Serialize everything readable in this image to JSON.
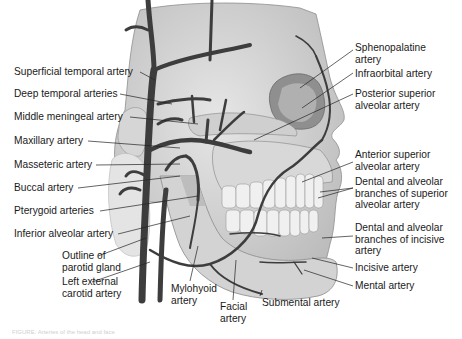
{
  "figure": {
    "caption": "FIGURE: Arteries of the head and face",
    "colors": {
      "artery": "#3d3d3d",
      "bone": "#d9d9d9",
      "bone_shadow": "#a8a8a8",
      "teeth": "#efefef",
      "skin_outline": "#c8c8c8",
      "leader_line": "#222222",
      "text": "#1a1a1a"
    }
  },
  "labels_left": [
    {
      "id": "superficial-temporal",
      "text": "Superficial temporal artery"
    },
    {
      "id": "deep-temporal",
      "text": "Deep temporal arteries"
    },
    {
      "id": "middle-meningeal",
      "text": "Middle meningeal artery"
    },
    {
      "id": "maxillary",
      "text": "Maxillary artery"
    },
    {
      "id": "masseteric",
      "text": "Masseteric artery"
    },
    {
      "id": "buccal",
      "text": "Buccal artery"
    },
    {
      "id": "pterygoid",
      "text": "Pterygoid arteries"
    },
    {
      "id": "inferior-alveolar",
      "text": "Inferior alveolar artery"
    },
    {
      "id": "parotid-outline",
      "line1": "Outline of",
      "line2": "parotid gland"
    },
    {
      "id": "left-external-carotid",
      "line1": "Left external",
      "line2": "carotid artery"
    }
  ],
  "labels_bottom": [
    {
      "id": "mylohyoid",
      "line1": "Mylohyoid",
      "line2": "artery"
    },
    {
      "id": "facial",
      "line1": "Facial",
      "line2": "artery"
    },
    {
      "id": "submental",
      "text": "Submental artery"
    }
  ],
  "labels_right": [
    {
      "id": "sphenopalatine",
      "line1": "Sphenopalatine",
      "line2": "artery"
    },
    {
      "id": "infraorbital",
      "text": "Infraorbital artery"
    },
    {
      "id": "posterior-superior-alveolar",
      "line1": "Posterior superior",
      "line2": "alveolar artery"
    },
    {
      "id": "anterior-superior-alveolar",
      "line1": "Anterior superior",
      "line2": "alveolar artery"
    },
    {
      "id": "dental-superior",
      "line1": "Dental and alveolar",
      "line2": "branches of superior",
      "line3": "alveolar artery"
    },
    {
      "id": "dental-incisive",
      "line1": "Dental and alveolar",
      "line2": "branches of incisive",
      "line3": "artery"
    },
    {
      "id": "incisive",
      "text": "Incisive artery"
    },
    {
      "id": "mental",
      "text": "Mental artery"
    }
  ]
}
